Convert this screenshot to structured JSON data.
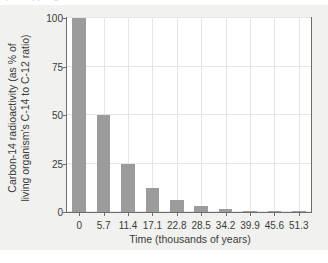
{
  "figure": {
    "background_color": "#f1f1ef",
    "plot_background_color": "#ffffff",
    "frame_color": "#6d6d6d",
    "grid_color": "#e4e4e4",
    "page_sliver_text": "p    t       t    e             pp        e    g"
  },
  "chart_data": {
    "type": "bar",
    "title": "",
    "xlabel": "Time (thousands of years)",
    "ylabel": "Carbon-14 radioactivity (as % of\nliving organism's C-14 to C-12 ratio)",
    "categories": [
      "0",
      "5.7",
      "11.4",
      "17.1",
      "22.8",
      "28.5",
      "34.2",
      "39.9",
      "45.6",
      "51.3"
    ],
    "values": [
      100,
      50,
      25,
      12.5,
      6.25,
      3.13,
      1.56,
      0.78,
      0.39,
      0.2
    ],
    "bar_color": "#9b9b9b",
    "xlim": [
      -0.5,
      9.5
    ],
    "ylim": [
      0,
      100
    ],
    "yticks": [
      0,
      25,
      50,
      75,
      100
    ],
    "ytick_labels": [
      "0",
      "25",
      "50",
      "75",
      "100"
    ],
    "xtick_labels": [
      "0",
      "5.7",
      "11.4",
      "17.1",
      "22.8",
      "28.5",
      "34.2",
      "39.9",
      "45.6",
      "51.3"
    ],
    "grid": true,
    "legend": false,
    "legend_position": "none"
  }
}
